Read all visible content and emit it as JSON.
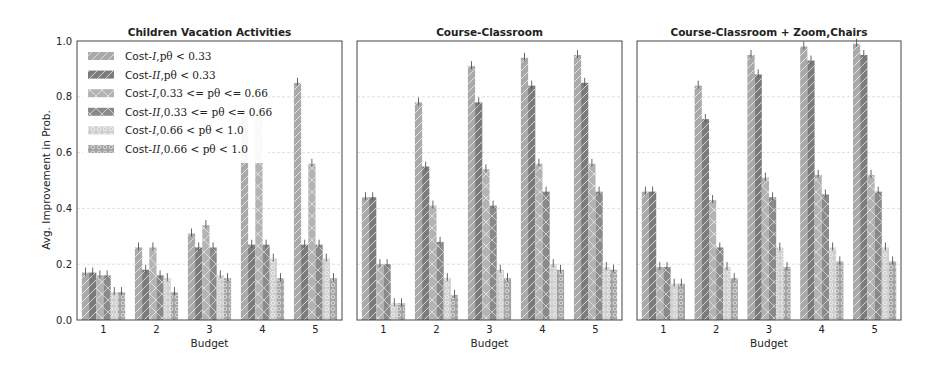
{
  "chart_data": [
    {
      "type": "bar",
      "title": "Children Vacation Activities",
      "xlabel": "Budget",
      "ylabel": "Avg. Improvement in Prob.",
      "ylim": [
        0,
        1.0
      ],
      "yticks": [
        0.0,
        0.2,
        0.4,
        0.6,
        0.8,
        1.0
      ],
      "grid": true,
      "legend_position": "upper left",
      "categories": [
        "1",
        "2",
        "3",
        "4",
        "5"
      ],
      "series": [
        {
          "name": "Cost-I, p_θ < 0.33",
          "values": [
            0.17,
            0.26,
            0.31,
            0.75,
            0.85
          ]
        },
        {
          "name": "Cost-II, p_θ < 0.33",
          "values": [
            0.17,
            0.18,
            0.26,
            0.27,
            0.27
          ]
        },
        {
          "name": "Cost-I, 0.33 <= p_θ <= 0.66",
          "values": [
            0.16,
            0.26,
            0.34,
            0.75,
            0.56
          ]
        },
        {
          "name": "Cost-II, 0.33 <= p_θ <= 0.66",
          "values": [
            0.16,
            0.16,
            0.26,
            0.27,
            0.27
          ]
        },
        {
          "name": "Cost-I, 0.66 < p_θ < 1.0",
          "values": [
            0.1,
            0.15,
            0.16,
            0.22,
            0.22
          ]
        },
        {
          "name": "Cost-II, 0.66 < p_θ < 1.0",
          "values": [
            0.1,
            0.1,
            0.15,
            0.15,
            0.15
          ]
        }
      ]
    },
    {
      "type": "bar",
      "title": "Course-Classroom",
      "xlabel": "Budget",
      "ylabel": "",
      "ylim": [
        0,
        1.0
      ],
      "grid": true,
      "categories": [
        "1",
        "2",
        "3",
        "4",
        "5"
      ],
      "series": [
        {
          "name": "Cost-I, p_θ < 0.33",
          "values": [
            0.44,
            0.78,
            0.91,
            0.94,
            0.95
          ]
        },
        {
          "name": "Cost-II, p_θ < 0.33",
          "values": [
            0.44,
            0.55,
            0.78,
            0.84,
            0.85
          ]
        },
        {
          "name": "Cost-I, 0.33 <= p_θ <= 0.66",
          "values": [
            0.2,
            0.41,
            0.54,
            0.56,
            0.56
          ]
        },
        {
          "name": "Cost-II, 0.33 <= p_θ <= 0.66",
          "values": [
            0.2,
            0.28,
            0.41,
            0.46,
            0.46
          ]
        },
        {
          "name": "Cost-I, 0.66 < p_θ < 1.0",
          "values": [
            0.06,
            0.15,
            0.18,
            0.2,
            0.19
          ]
        },
        {
          "name": "Cost-II, 0.66 < p_θ < 1.0",
          "values": [
            0.06,
            0.09,
            0.15,
            0.18,
            0.18
          ]
        }
      ]
    },
    {
      "type": "bar",
      "title": "Course-Classroom + Zoom,Chairs",
      "xlabel": "Budget",
      "ylabel": "",
      "ylim": [
        0,
        1.0
      ],
      "grid": true,
      "categories": [
        "1",
        "2",
        "3",
        "4",
        "5"
      ],
      "series": [
        {
          "name": "Cost-I, p_θ < 0.33",
          "values": [
            0.46,
            0.84,
            0.95,
            0.98,
            0.99
          ]
        },
        {
          "name": "Cost-II, p_θ < 0.33",
          "values": [
            0.46,
            0.72,
            0.88,
            0.93,
            0.95
          ]
        },
        {
          "name": "Cost-I, 0.33 <= p_θ <= 0.66",
          "values": [
            0.19,
            0.43,
            0.51,
            0.52,
            0.52
          ]
        },
        {
          "name": "Cost-II, 0.33 <= p_θ <= 0.66",
          "values": [
            0.19,
            0.26,
            0.44,
            0.45,
            0.46
          ]
        },
        {
          "name": "Cost-I, 0.66 < p_θ < 1.0",
          "values": [
            0.13,
            0.19,
            0.26,
            0.26,
            0.26
          ]
        },
        {
          "name": "Cost-II, 0.66 < p_θ < 1.0",
          "values": [
            0.13,
            0.15,
            0.19,
            0.21,
            0.21
          ]
        }
      ]
    }
  ],
  "legend": [
    {
      "prefix": "Cost-",
      "cost": "I",
      "cond": ",pθ < 0.33",
      "color": "#a9a9a9",
      "pattern": "diag"
    },
    {
      "prefix": "Cost-",
      "cost": "II",
      "cond": ",pθ < 0.33",
      "color": "#7b7b7b",
      "pattern": "diag"
    },
    {
      "prefix": "Cost-",
      "cost": "I",
      "cond": ",0.33 <= pθ <= 0.66",
      "color": "#b3b3b3",
      "pattern": "cross"
    },
    {
      "prefix": "Cost-",
      "cost": "II",
      "cond": ",0.33 <= pθ <= 0.66",
      "color": "#8a8a8a",
      "pattern": "cross"
    },
    {
      "prefix": "Cost-",
      "cost": "I",
      "cond": ",0.66 < pθ < 1.0",
      "color": "#cfcfcf",
      "pattern": "circle"
    },
    {
      "prefix": "Cost-",
      "cost": "II",
      "cond": ",0.66 < pθ < 1.0",
      "color": "#a3a3a3",
      "pattern": "circle"
    }
  ],
  "axis": {
    "ylabel": "Avg. Improvement in Prob.",
    "xlabel": "Budget"
  }
}
